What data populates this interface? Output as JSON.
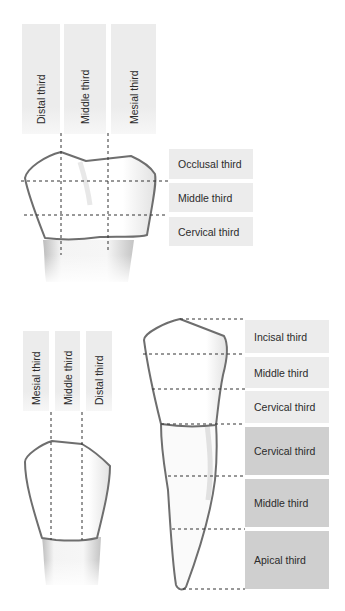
{
  "molar": {
    "vertical_labels": [
      "Distal third",
      "Middle third",
      "Mesial third"
    ],
    "horizontal_labels": [
      "Occlusal third",
      "Middle third",
      "Cervical third"
    ]
  },
  "incisor_side": {
    "vertical_labels": [
      "Mesial third",
      "Middle third",
      "Distal third"
    ]
  },
  "canine": {
    "crown_labels": [
      "Incisal third",
      "Middle third",
      "Cervical third"
    ],
    "root_labels": [
      "Cervical third",
      "Middle third",
      "Apical third"
    ]
  },
  "colors": {
    "label_bg_light": "#ececec",
    "label_bg_dark": "#cfcfcf",
    "outline": "#6e6e6e",
    "text": "#2b2b2b"
  }
}
